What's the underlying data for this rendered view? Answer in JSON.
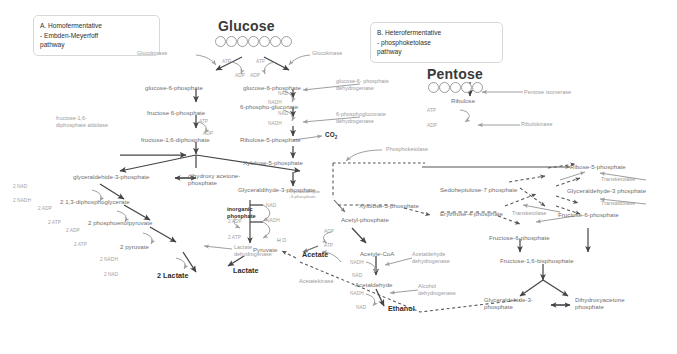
{
  "figure": {
    "title_a": "A. Homofermentative\n- Embden-Meyerfoff\npathway",
    "title_b": "B. Heterofermentative\n- phosphoketolase\npathway",
    "heading_glucose": "Glucose",
    "heading_pentose": "Pentose"
  },
  "metabolites": {
    "g6p_left": "glucose-6-phosphate",
    "f6p_left": "fructose 6-phosphate",
    "fdp": "fructose-1,6-diphosphate",
    "gap_left": "glyceraldehide-3-phosphate",
    "dhap_left": "dihydroxy aceto­ne-\nphosphate",
    "dpg": "2 1,3-diphosphoglycerate",
    "pep": "2 phosphoenolpyruvate",
    "pyruvate_left": "2 pyruvate",
    "lactate_left": "2 Lactate",
    "g6p_right": "glucose-6-phosphate",
    "pg": "6-phospho-gluconate",
    "ribulose5p": "Ribulose-5-phosphate",
    "xylulose5p_center": "Xylulose-5-phosphate",
    "gap_center": "Glyceraldihyde-3-phosphate",
    "inorganic_phosphate": "inorganic\nphosphate",
    "pyruvate_center": "Pyruvate",
    "lactate_center": "Lactate",
    "acetyl_phosphate": "Acetyl-phosphate",
    "acetate": "Acetate",
    "acetyl_coa": "Acetyle-CoA",
    "acetaldehyde": "Acetaldehyde",
    "ethanol": "Ethanol",
    "ribulose": "Ribulose",
    "xylulose5p_right": "Xylulose-5-phosphate",
    "sedoheptulose7p": "Sedoheptulose-7 phosphate",
    "erythrose4p": "Erythrose-4-phosphate",
    "ribose5p": "Ribose-5-phosphate",
    "gap_right": "Glyceraldehyde-3 phosphate",
    "f6p_right_a": "Fructose-6-phosphate",
    "f6p_right_b": "Fructose-6-phosphate",
    "fbp_right": "Fructose-1,6-bisphosphate",
    "gap_bottom": "Glyceraldehide-3-\nphosphate",
    "dhap_bottom": "Dihydroxyacetone\nphosphate",
    "co2": "CO",
    "co2_sub": "2",
    "water": "H O",
    "water_sub": "2"
  },
  "enzymes": {
    "glucokinase_left": "Glucokinase",
    "glucokinase_right": "Glucokinase",
    "aldolase": "fructose-1,6-\ndiphosphate aldolase",
    "ldh_left": "Lactate\ndehydrogenase",
    "g6pdh": "glucose-6- phosphate\ndehydrogenase",
    "pgdh": "6-phosphogluconate\ndehydrogenase",
    "phosphoketolase": "Phosphoketolase",
    "gap_dh": "Glyceraldehyde\n-3-phosphate",
    "acetatekinase": "Acetatekinase",
    "acetaldehyde_dh": "Acetaldehyde\ndehydrogenase",
    "alcohol_dh": "Alcohol\ndehydrogenase",
    "pentose_isomerase": "Pentose isomerase",
    "ribulokinase": "Ribulokinase",
    "transketolase_top": "Transketolase",
    "transaldolase": "Transaldolase",
    "transketolase_bottom": "Transketolase"
  },
  "cofactors": {
    "atp_l": "ATP",
    "adp_l": "ADP",
    "atp_r": "ATP",
    "adp_r": "ADP",
    "atp_f6p": "ATP",
    "adp_f6p": "ADP",
    "nad_r1": "NAD",
    "nadh_r1": "NADH",
    "nad_r2": "NAD",
    "nadh_r2": "NADH",
    "nad_gap": "2 NAD",
    "nadh_gap": "2 NADH",
    "adp_dpg": "2 ADP",
    "atp_dpg": "2 ATP",
    "adp_pep": "2 ADP",
    "atp_pep": "2 ATP",
    "nadh_lac": "2 NADH",
    "nad_lac": "2 NAD",
    "nad_c": "NAD",
    "nadh_c": "NADH",
    "adp_c": "2 ADP",
    "atp_c": "2 ATP",
    "adp_ac": "ADP",
    "atp_ac": "ATP",
    "nadh_coa": "NADH",
    "nad_coa": "NAD",
    "nadh_eth": "NADH",
    "nad_eth": "NAD",
    "atp_ribu": "ATP",
    "adp_ribu": "ADP"
  },
  "colors": {
    "text_gray": "#8a8a8a",
    "text_dark": "#2b2b2b",
    "arrow": "#5a5a5a",
    "arrow_light": "#9e9e9e",
    "box_border": "#d8d8d8"
  }
}
